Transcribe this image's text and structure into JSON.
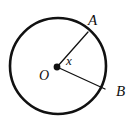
{
  "figure": {
    "type": "geometry-diagram",
    "background_color": "#ffffff",
    "stroke_color": "#111111",
    "circle": {
      "center_x": 58,
      "center_y": 66,
      "radius": 48,
      "stroke_width": 2.6
    },
    "center_point": {
      "label": "O",
      "x": 57,
      "y": 67,
      "dot_radius": 3.4
    },
    "radii": [
      {
        "name": "radius-OA",
        "from_x": 57,
        "from_y": 67,
        "to_x": 88,
        "to_y": 32,
        "stroke_width": 1.3
      },
      {
        "name": "radius-OB",
        "from_x": 57,
        "from_y": 67,
        "to_x": 105,
        "to_y": 89,
        "stroke_width": 1.3
      }
    ],
    "labels": {
      "point_a": "A",
      "point_b": "B",
      "center": "O",
      "angle": "x"
    }
  }
}
